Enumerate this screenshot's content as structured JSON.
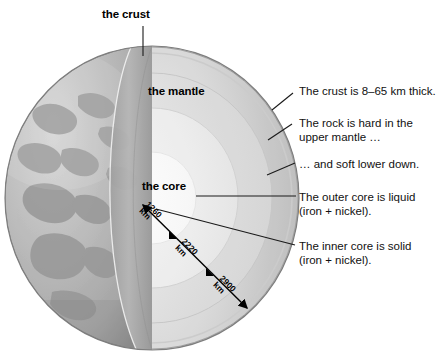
{
  "figure": {
    "layer_labels": [
      {
        "id": "crust",
        "text": "the crust"
      },
      {
        "id": "mantle",
        "text": "the mantle"
      },
      {
        "id": "core",
        "text": "the core"
      }
    ],
    "annotations": [
      {
        "id": "crust-thickness",
        "lines": [
          "The crust is 8–65 km thick."
        ]
      },
      {
        "id": "upper-mantle",
        "lines": [
          "The rock is hard in the",
          "upper mantle …"
        ]
      },
      {
        "id": "lower-mantle",
        "lines": [
          "… and soft lower down."
        ]
      },
      {
        "id": "outer-core",
        "lines": [
          "The outer core is liquid",
          "(iron + nickel)."
        ]
      },
      {
        "id": "inner-core",
        "lines": [
          "The inner core is solid",
          "(iron + nickel)."
        ]
      }
    ],
    "depth_scale": [
      {
        "id": "inner-core-radius",
        "value": "1260",
        "unit": "km"
      },
      {
        "id": "outer-core-radius",
        "value": "2220",
        "unit": "km"
      },
      {
        "id": "mantle-depth",
        "value": "2900",
        "unit": "km"
      }
    ],
    "colors": {
      "background": "#ffffff",
      "text": "#000000",
      "leader_line": "#1a1a1a",
      "globe_ocean": "#b4b4b4",
      "globe_land": "#9a9a9a",
      "crust_band": "#a8a8a8",
      "mantle_outer": "#bdbdbd",
      "mantle_inner": "#d2d2d2",
      "outer_core": "#e2e2e2",
      "inner_core": "#f5f5f5"
    }
  }
}
